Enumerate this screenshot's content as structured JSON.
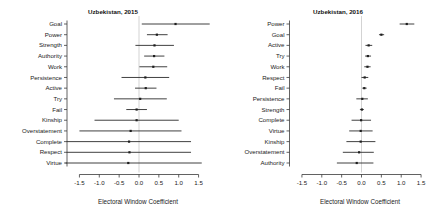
{
  "figure": {
    "panels": [
      {
        "id": "left",
        "title": "Uzbekistan, 2015",
        "xlabel": "Electoral Window Coefficient"
      },
      {
        "id": "right",
        "title": "Uzbekistan, 2016",
        "xlabel": "Electoral Window Coefficient"
      }
    ]
  },
  "chart_data": [
    {
      "type": "scatter",
      "subtype": "forest-plot",
      "title": "Uzbekistan, 2015",
      "xlabel": "Electoral Window Coefficient",
      "ylabel": "",
      "xlim": [
        -1.75,
        1.75
      ],
      "xticks": [
        -1.5,
        -1.0,
        -0.5,
        0.0,
        0.5,
        1.0,
        1.5
      ],
      "xticklabels": [
        "-1.5",
        "-1.0",
        "-0.5",
        "0.0",
        "0.5",
        "1.0",
        "1.5"
      ],
      "grid": false,
      "reference_line": 0.0,
      "legend": "none",
      "categories": [
        "Goal",
        "Power",
        "Strength",
        "Authority",
        "Work",
        "Persistence",
        "Active",
        "Try",
        "Fail",
        "Kinship",
        "Overstatement",
        "Complete",
        "Respect",
        "Virtue"
      ],
      "points": [
        {
          "label": "Goal",
          "estimate": 0.92,
          "ci_low": 0.07,
          "ci_high": 1.78
        },
        {
          "label": "Power",
          "estimate": 0.45,
          "ci_low": 0.2,
          "ci_high": 0.72
        },
        {
          "label": "Strength",
          "estimate": 0.39,
          "ci_low": -0.09,
          "ci_high": 0.88
        },
        {
          "label": "Authority",
          "estimate": 0.38,
          "ci_low": 0.13,
          "ci_high": 0.64
        },
        {
          "label": "Work",
          "estimate": 0.36,
          "ci_low": 0.01,
          "ci_high": 0.71
        },
        {
          "label": "Persistence",
          "estimate": 0.16,
          "ci_low": -0.44,
          "ci_high": 0.76
        },
        {
          "label": "Active",
          "estimate": 0.17,
          "ci_low": -0.1,
          "ci_high": 0.44
        },
        {
          "label": "Try",
          "estimate": 0.03,
          "ci_low": -0.63,
          "ci_high": 0.7
        },
        {
          "label": "Fail",
          "estimate": -0.06,
          "ci_low": -0.32,
          "ci_high": 0.2
        },
        {
          "label": "Kinship",
          "estimate": -0.06,
          "ci_low": -1.12,
          "ci_high": 1.0
        },
        {
          "label": "Overstatement",
          "estimate": -0.21,
          "ci_low": -1.5,
          "ci_high": 1.07
        },
        {
          "label": "Complete",
          "estimate": -0.25,
          "ci_low": -1.82,
          "ci_high": 1.31
        },
        {
          "label": "Respect",
          "estimate": -0.24,
          "ci_low": -1.82,
          "ci_high": 1.31
        },
        {
          "label": "Virtue",
          "estimate": -0.27,
          "ci_low": -1.85,
          "ci_high": 1.58
        }
      ]
    },
    {
      "type": "scatter",
      "subtype": "forest-plot",
      "title": "Uzbekistan, 2016",
      "xlabel": "Electoral Window Coefficient",
      "ylabel": "",
      "xlim": [
        -1.75,
        1.75
      ],
      "xticks": [
        -1.5,
        -1.0,
        -0.5,
        0.0,
        0.5,
        1.0,
        1.5
      ],
      "xticklabels": [
        "-1.5",
        "-1.0",
        "-0.5",
        "0.0",
        "0.5",
        "1.0",
        "1.5"
      ],
      "grid": false,
      "reference_line": 0.0,
      "legend": "none",
      "categories": [
        "Power",
        "Goal",
        "Active",
        "Try",
        "Work",
        "Respect",
        "Fail",
        "Persistence",
        "Strength",
        "Complete",
        "Virtue",
        "Kinship",
        "Overstatement",
        "Authority"
      ],
      "points": [
        {
          "label": "Power",
          "estimate": 1.14,
          "ci_low": 0.96,
          "ci_high": 1.33
        },
        {
          "label": "Goal",
          "estimate": 0.5,
          "ci_low": 0.44,
          "ci_high": 0.57
        },
        {
          "label": "Active",
          "estimate": 0.18,
          "ci_low": 0.1,
          "ci_high": 0.27
        },
        {
          "label": "Try",
          "estimate": 0.16,
          "ci_low": 0.09,
          "ci_high": 0.24
        },
        {
          "label": "Work",
          "estimate": 0.15,
          "ci_low": 0.07,
          "ci_high": 0.23
        },
        {
          "label": "Respect",
          "estimate": 0.08,
          "ci_low": 0.0,
          "ci_high": 0.17
        },
        {
          "label": "Fail",
          "estimate": 0.07,
          "ci_low": 0.02,
          "ci_high": 0.13
        },
        {
          "label": "Persistence",
          "estimate": 0.02,
          "ci_low": -0.13,
          "ci_high": 0.16
        },
        {
          "label": "Strength",
          "estimate": 0.01,
          "ci_low": -0.04,
          "ci_high": 0.06
        },
        {
          "label": "Complete",
          "estimate": -0.01,
          "ci_low": -0.25,
          "ci_high": 0.24
        },
        {
          "label": "Virtue",
          "estimate": -0.02,
          "ci_low": -0.31,
          "ci_high": 0.28
        },
        {
          "label": "Kinship",
          "estimate": -0.02,
          "ci_low": -0.38,
          "ci_high": 0.35
        },
        {
          "label": "Overstatement",
          "estimate": -0.06,
          "ci_low": -0.47,
          "ci_high": 0.31
        },
        {
          "label": "Authority",
          "estimate": -0.12,
          "ci_low": -0.62,
          "ci_high": 0.3
        }
      ]
    }
  ],
  "style": {
    "line_color": "#2b2b2b",
    "point_color": "#1e1e1e",
    "axis_color": "#3a3a3a",
    "reference_line_color": "#c8c8c8",
    "background": "#ffffff"
  }
}
